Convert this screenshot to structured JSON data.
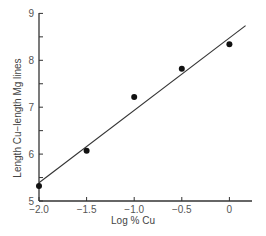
{
  "chart_data": {
    "type": "scatter",
    "title": "",
    "xlabel": "Log % Cu",
    "ylabel": "Length Cu−length Mg lines",
    "xlim": [
      -2.0,
      0.25
    ],
    "ylim": [
      5,
      9
    ],
    "xticks": [
      -2.0,
      -1.5,
      -1.0,
      -0.5,
      0
    ],
    "xtick_labels": [
      "−2.0",
      "−1.5",
      "−1.0",
      "−0.5",
      "0"
    ],
    "yticks": [
      5,
      5.5,
      6,
      6.5,
      7,
      7.5,
      8,
      8.5,
      9
    ],
    "ytick_labels": [
      "5",
      "",
      "6",
      "",
      "7",
      "",
      "8",
      "",
      "9"
    ],
    "grid": false,
    "legend": null,
    "series": [
      {
        "name": "measurements",
        "marker": "filled-circle",
        "x": [
          -2.0,
          -1.5,
          -1.0,
          -0.5,
          0.0
        ],
        "y": [
          5.32,
          6.07,
          7.22,
          7.82,
          8.34
        ]
      }
    ],
    "fit_line": {
      "name": "linear fit",
      "x": [
        -2.0,
        0.17
      ],
      "y": [
        5.39,
        8.74
      ]
    }
  },
  "caption_fragment": "… for  ·  ·  · ld  ·  ·  ·"
}
